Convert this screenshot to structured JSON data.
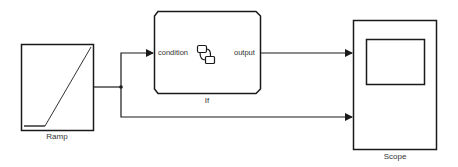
{
  "diagram": {
    "type": "simulink-model",
    "blocks": [
      {
        "id": "ramp",
        "label": "Ramp",
        "icon": "ramp-icon"
      },
      {
        "id": "if",
        "label": "If",
        "icon": "stateflow-chart-icon",
        "ports": {
          "input": "condition",
          "output": "output"
        }
      },
      {
        "id": "scope",
        "label": "Scope",
        "icon": "scope-screen-icon"
      }
    ],
    "connections": [
      {
        "from": "Ramp",
        "to": "If.condition"
      },
      {
        "from": "If.output",
        "to": "Scope.input1"
      },
      {
        "from": "Ramp",
        "to": "Scope.input2"
      }
    ],
    "colors": {
      "line": "#1a1a1a",
      "background": "#ffffff",
      "text": "#333333"
    }
  }
}
